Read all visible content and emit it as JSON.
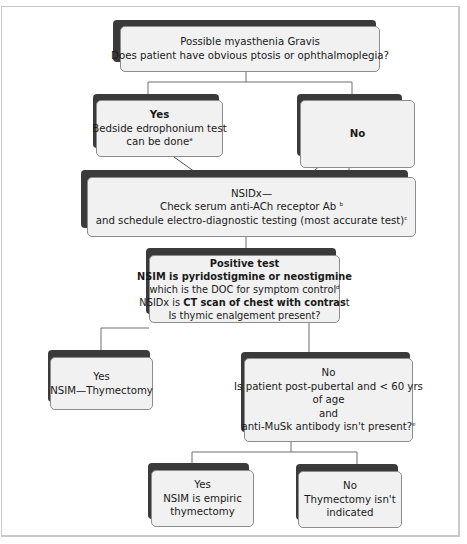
{
  "colors": {
    "box_fill": "#f1f1f1",
    "box_border": "#8c8c8c",
    "box_shadow": "#3a3a3a",
    "connector": "#6f6f6f",
    "frame_border": "#c9c9c9"
  },
  "nodes": {
    "start": {
      "line1": "Possible myasthenia Gravis",
      "line2": "Does patient have obvious ptosis or ophthalmoplegia?"
    },
    "yes_ptosis": {
      "title": "Yes",
      "line1": "Bedside edrophonium test",
      "line2": "can be done",
      "footnote": "a"
    },
    "no_ptosis": {
      "title": "No"
    },
    "nsidx_serology": {
      "line1": "NSIDx—",
      "line2": "Check serum  anti-ACh receptor Ab ",
      "line2_footnote": "b",
      "line3": "and schedule  electro-diagnostic testing (most accurate test)",
      "line3_footnote": "c"
    },
    "positive_test": {
      "title": "Positive test",
      "line1": "NSIM is pyridostigmine or neostigmine",
      "line2": "which is the DOC for symptom control",
      "line2_footnote": "d",
      "line3_prefix": "NSIDx is ",
      "line3_bold": "CT scan of chest with contras",
      "line3_suffix": "t",
      "line4": "Is thymic enalgement present?"
    },
    "yes_thymic": {
      "title": "Yes",
      "line1": "NSIM—Thymectomy"
    },
    "no_thymic": {
      "title": "No",
      "line1": "Is patient post-pubertal and <  60 yrs",
      "line2": "of age",
      "line3": "and",
      "line4": "anti-MuSk antibody isn't present?",
      "footnote": "e"
    },
    "yes_empiric": {
      "title": "Yes",
      "line1": "NSIM is empiric",
      "line2": "thymectomy"
    },
    "no_indicated": {
      "title": "No",
      "line1": "Thymectomy isn't",
      "line2": "indicated"
    }
  }
}
